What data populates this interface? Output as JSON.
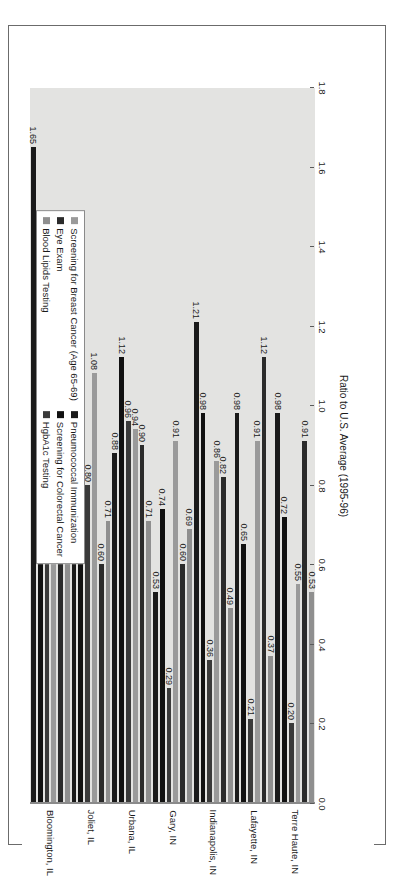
{
  "chart_data": {
    "type": "bar",
    "orientation": "horizontal",
    "title": "",
    "xlabel": "",
    "ylabel": "Ratio to U.S. Average (1995-96)",
    "axis_title": "Ratio to U.S. Average (1995-96)",
    "ylim": [
      0.0,
      1.8
    ],
    "tick_labels": [
      "0.0",
      "0.2",
      "0.4",
      "0.6",
      "0.8",
      "1.0",
      "1.2",
      "1.4",
      "1.6",
      "1.8"
    ],
    "tick_values": [
      0.0,
      0.2,
      0.4,
      0.6,
      0.8,
      1.0,
      1.2,
      1.4,
      1.6,
      1.8
    ],
    "grid": false,
    "legend_position": "top-left",
    "categories": [
      "Bloomington, IL",
      "Joliet, IL",
      "Urbana, IL",
      "Gary, IN",
      "Indianapolis, IN",
      "Lafayette, IN",
      "Terre Haute, IN"
    ],
    "series": [
      {
        "name": "Pneumococcal Immunization",
        "color": "#1a1a1a",
        "values": [
          1.65,
          0.76,
          0.88,
          0.53,
          1.21,
          0.98,
          0.98
        ]
      },
      {
        "name": "Screening for Colorectal Cancer",
        "color": "#111111",
        "values": [
          1.09,
          1.11,
          1.12,
          0.74,
          0.98,
          0.65,
          0.72
        ]
      },
      {
        "name": "HgbA1c Testing",
        "color": "#3a3a3a",
        "values": [
          0.95,
          0.8,
          0.96,
          0.29,
          0.36,
          0.21,
          0.2
        ]
      },
      {
        "name": "Screening for Breast Cancer (Age 65-69)",
        "color": "#9a9a9a",
        "values": [
          0.63,
          1.08,
          0.94,
          0.91,
          0.86,
          0.91,
          0.55
        ]
      },
      {
        "name": "Eye Exam",
        "color": "#2b2b2b",
        "values": [
          1.41,
          0.6,
          0.9,
          0.6,
          0.82,
          1.12,
          0.91
        ]
      },
      {
        "name": "Blood Lipids Testing",
        "color": "#8f8f8f",
        "values": [
          0.88,
          0.71,
          0.71,
          0.69,
          0.49,
          0.37,
          0.53
        ]
      }
    ],
    "data_labels": {
      "Bloomington, IL": [
        "1.65",
        "1.09",
        "0.95",
        "0.63",
        "1.41",
        "0.88"
      ],
      "Joliet, IL": [
        "0.76",
        "1.11",
        "0.80",
        "1.08",
        "0.60",
        "0.71"
      ],
      "Urbana, IL": [
        "0.88",
        "1.12",
        "0.96",
        "0.94",
        "0.90",
        "0.71"
      ],
      "Gary, IN": [
        "0.53",
        "0.74",
        "0.29",
        "0.91",
        "0.60",
        "0.69"
      ],
      "Indianapolis, IN": [
        "1.21",
        "0.98",
        "0.36",
        "0.86",
        "0.82",
        "0.49"
      ],
      "Lafayette, IN": [
        "0.98",
        "0.65",
        "0.21",
        "0.91",
        "1.12",
        "0.37"
      ],
      "Terre Haute, IN": [
        "0.98",
        "0.72",
        "0.20",
        "0.55",
        "0.91",
        "0.53"
      ]
    },
    "legend": [
      {
        "label": "Pneumococcal Immunization",
        "color": "#1a1a1a"
      },
      {
        "label": "Screening for Colorectal Cancer",
        "color": "#111111"
      },
      {
        "label": "HgbA1c Testing",
        "color": "#3a3a3a"
      },
      {
        "label": "Screening for Breast Cancer (Age 65-69)",
        "color": "#9a9a9a"
      },
      {
        "label": "Eye Exam",
        "color": "#2b2b2b"
      },
      {
        "label": "Blood Lipids Testing",
        "color": "#8f8f8f"
      }
    ],
    "colors": {
      "plot_background": "#e3e3e1",
      "page_background": "#ffffff",
      "axis": "#8a8a8a",
      "text": "#1a1a1a"
    }
  }
}
